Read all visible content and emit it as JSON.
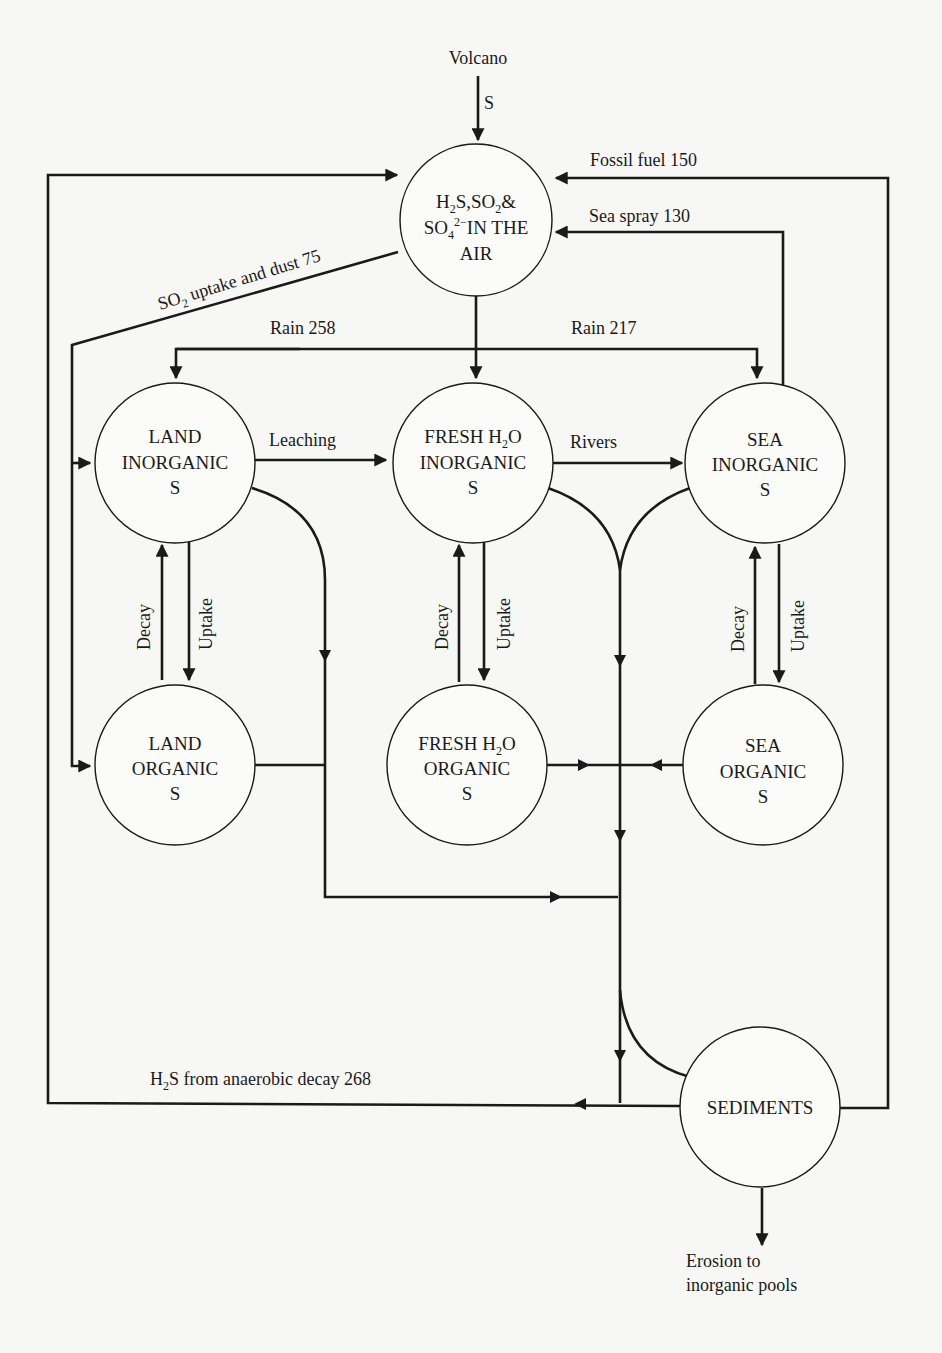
{
  "diagram": {
    "nodes": {
      "air": {
        "line1_a": "H",
        "line1_sub1": "2",
        "line1_b": "S,SO",
        "line1_sub2": "2",
        "line1_c": "&",
        "line2_a": "SO",
        "line2_sub": "4",
        "line2_sup": "2−",
        "line2_b": "IN THE",
        "line3": "AIR"
      },
      "land_inorganic": {
        "line1": "LAND",
        "line2": "INORGANIC",
        "line3": "S"
      },
      "fresh_inorganic": {
        "line1_a": "FRESH H",
        "line1_sub": "2",
        "line1_b": "O",
        "line2": "INORGANIC",
        "line3": "S"
      },
      "sea_inorganic": {
        "line1": "SEA",
        "line2": "INORGANIC",
        "line3": "S"
      },
      "land_organic": {
        "line1": "LAND",
        "line2": "ORGANIC",
        "line3": "S"
      },
      "fresh_organic": {
        "line1_a": "FRESH H",
        "line1_sub": "2",
        "line1_b": "O",
        "line2": "ORGANIC",
        "line3": "S"
      },
      "sea_organic": {
        "line1": "SEA",
        "line2": "ORGANIC",
        "line3": "S"
      },
      "sediments": {
        "line1": "SEDIMENTS"
      }
    },
    "flows": {
      "volcano": "Volcano",
      "volcano_s": "S",
      "fossil_fuel": "Fossil fuel 150",
      "sea_spray": "Sea spray 130",
      "so2_uptake_a": "SO",
      "so2_uptake_sub": "2",
      "so2_uptake_b": " uptake and dust 75",
      "rain_land": "Rain 258",
      "rain_sea": "Rain 217",
      "leaching": "Leaching",
      "rivers": "Rivers",
      "decay": "Decay",
      "uptake": "Uptake",
      "h2s_a": "H",
      "h2s_sub": "2",
      "h2s_b": "S from anaerobic decay 268",
      "erosion_line1": "Erosion to",
      "erosion_line2": "inorganic pools"
    },
    "flow_values": {
      "fossil_fuel": 150,
      "sea_spray": 130,
      "so2_uptake_and_dust": 75,
      "rain_land": 258,
      "rain_sea": 217,
      "h2s_anaerobic_decay": 268
    }
  }
}
